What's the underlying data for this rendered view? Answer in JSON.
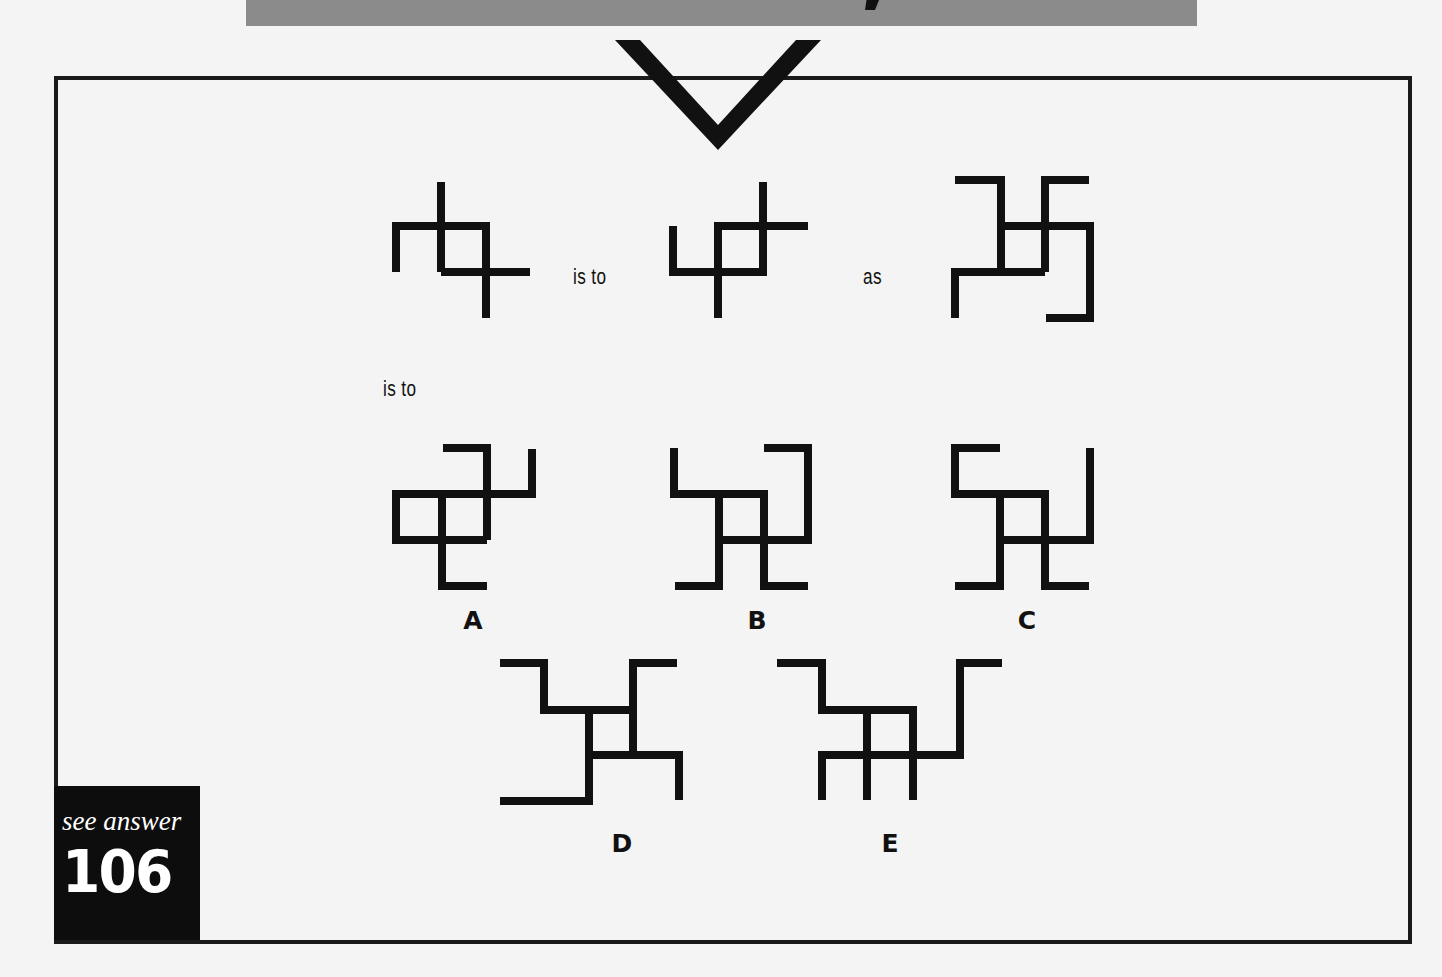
{
  "puzzle": {
    "connector_is_to": "is to",
    "connector_as": "as",
    "connector_is_to_2": "is to",
    "options": [
      {
        "label": "A"
      },
      {
        "label": "B"
      },
      {
        "label": "C"
      },
      {
        "label": "D"
      },
      {
        "label": "E"
      }
    ]
  },
  "answer_ref": {
    "text": "see answer",
    "number": "106"
  },
  "colors": {
    "ink": "#111111",
    "banner": "#8b8b8b",
    "background": "#f4f4f4",
    "answer_box": "#0d0d0d"
  }
}
